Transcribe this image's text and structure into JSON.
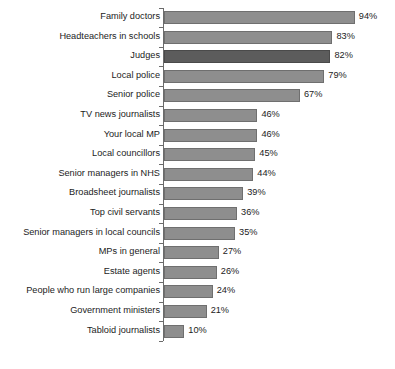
{
  "chart_data": {
    "type": "bar",
    "orientation": "horizontal",
    "title": "",
    "subtitle": "",
    "xlabel": "",
    "ylabel": "",
    "xlim": [
      0,
      100
    ],
    "grid": false,
    "legend": null,
    "value_suffix": "%",
    "categories": [
      "Family doctors",
      "Headteachers in schools",
      "Judges",
      "Local police",
      "Senior police",
      "TV news journalists",
      "Your local MP",
      "Local councillors",
      "Senior managers in NHS",
      "Broadsheet journalists",
      "Top civil servants",
      "Senior managers in local councils",
      "MPs in general",
      "Estate agents",
      "People who run large companies",
      "Government ministers",
      "Tabloid journalists"
    ],
    "values": [
      94,
      83,
      82,
      79,
      67,
      46,
      46,
      45,
      44,
      39,
      36,
      35,
      27,
      26,
      24,
      21,
      10
    ],
    "value_labels": [
      "94%",
      "83%",
      "82%",
      "79%",
      "67%",
      "46%",
      "46%",
      "45%",
      "44%",
      "39%",
      "36%",
      "35%",
      "27%",
      "26%",
      "24%",
      "21%",
      "10%"
    ],
    "highlighted_index": 2,
    "colors": {
      "bar": "#8e8e8e",
      "bar_outline": "#6f6f6f",
      "bar_highlight": "#5c5c5c",
      "bar_highlight_outline": "#4a4a4a",
      "axis": "#6b6b6b",
      "text": "#1c1c1c",
      "background": "#ffffff"
    }
  }
}
